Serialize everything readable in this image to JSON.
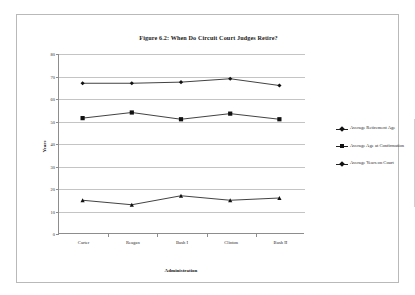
{
  "figure": {
    "title": "Figure 6.2: When Do Circuit Court Judges Retire?"
  },
  "chart_data": {
    "type": "line",
    "title": "Figure 6.2: When Do Circuit Court Judges Retire?",
    "xlabel": "Administration",
    "ylabel": "Years",
    "categories": [
      "Carter",
      "Reagan",
      "Bush I",
      "Clinton",
      "Bush II"
    ],
    "ylim": [
      0,
      80
    ],
    "yticks": [
      0,
      10,
      20,
      30,
      40,
      50,
      60,
      70,
      80
    ],
    "ytick_labels": [
      "0",
      "10",
      "20",
      "30",
      "40",
      "50",
      "60",
      "70",
      "80"
    ],
    "grid": true,
    "legend_position": "right",
    "series": [
      {
        "name": "Average Retirement Age",
        "marker": "diamond",
        "color": "#111111",
        "values": [
          67,
          67,
          67.5,
          69,
          66
        ]
      },
      {
        "name": "Average Age at Confirmation",
        "marker": "square",
        "color": "#111111",
        "values": [
          51.5,
          54,
          51,
          53.5,
          51
        ]
      },
      {
        "name": "Average Years on Court",
        "marker": "triangle",
        "color": "#111111",
        "values": [
          15,
          13,
          17,
          15,
          16
        ]
      }
    ]
  }
}
